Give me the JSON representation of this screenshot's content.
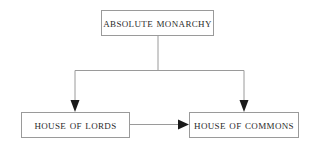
{
  "diagram": {
    "canvas": {
      "width": 312,
      "height": 145,
      "background": "#ffffff"
    },
    "style": {
      "line_color": "#9a9a9a",
      "arrow_fill": "#1a1a1a",
      "box_border_color": "#9a9a9a",
      "box_fill": "#ffffff",
      "text_color": "#2b2b2b"
    },
    "nodes": [
      {
        "id": "absolute-monarchy",
        "label": "Absolute Monarchy",
        "x": 101,
        "y": 10,
        "width": 113,
        "height": 26
      },
      {
        "id": "house-of-lords",
        "label": "House of Lords",
        "x": 21,
        "y": 112,
        "width": 109,
        "height": 26
      },
      {
        "id": "house-of-commons",
        "label": "House of Commons",
        "x": 189,
        "y": 112,
        "width": 110,
        "height": 26
      }
    ],
    "edges": [
      {
        "id": "monarchy-to-lords",
        "from": "absolute-monarchy",
        "to": "house-of-lords",
        "kind": "elbow-down",
        "arrowhead": "filled-triangle"
      },
      {
        "id": "monarchy-to-commons",
        "from": "absolute-monarchy",
        "to": "house-of-commons",
        "kind": "elbow-down",
        "arrowhead": "filled-triangle"
      },
      {
        "id": "lords-to-commons",
        "from": "house-of-lords",
        "to": "house-of-commons",
        "kind": "straight-horizontal",
        "arrowhead": "filled-triangle"
      }
    ]
  }
}
